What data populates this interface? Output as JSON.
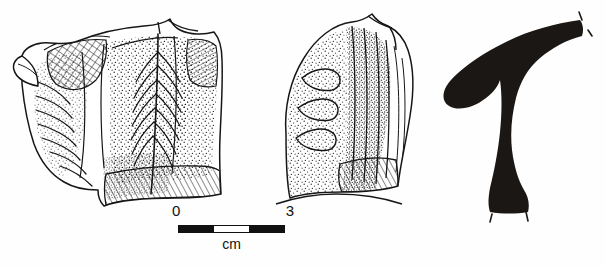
{
  "plate": {
    "title": "Archaeological pottery sherd illustration plate",
    "background_color": "#fefefe",
    "ink_color": "#111111",
    "width": 606,
    "height": 266
  },
  "figures": [
    {
      "id": "front-view",
      "name": "Front view of decorated pottery sherd",
      "view": "exterior / frontal",
      "technique": "line drawing with stipple shading and cross-hatching",
      "features": [
        "projecting lug or spout at upper left",
        "cross-hatched triangular panel on lug",
        "radiating incised ribs along lower left margin",
        "central feather or leaf vein motif in stipple",
        "parallel oblique hatching band along basal edge",
        "broken irregular right and lower edges"
      ]
    },
    {
      "id": "side-view",
      "name": "Side view of pottery sherd",
      "view": "lateral / profile elevation",
      "technique": "line drawing with stipple shading",
      "features": [
        "rounded dome-shaped upper body",
        "three curved incised loops at left in stipple field",
        "vertical ribbed band down centre",
        "oblique hatched basal flange",
        "undulating broken lower edge"
      ]
    },
    {
      "id": "section-profile",
      "name": "Vessel wall section profile",
      "view": "cross-section",
      "technique": "solid black silhouette",
      "fill_color": "#1a1714",
      "features": [
        "everted horizontal rim extending to the right",
        "sharp shoulder carination at upper left",
        "sinuous descending wall",
        "break tick marks at rim terminal and basal terminal"
      ]
    }
  ],
  "scale": {
    "start_label": "0",
    "end_label": "3",
    "unit_label": "cm",
    "segments": 3,
    "segment_pattern": [
      "dark",
      "light",
      "dark"
    ],
    "total_length_cm": 3
  }
}
